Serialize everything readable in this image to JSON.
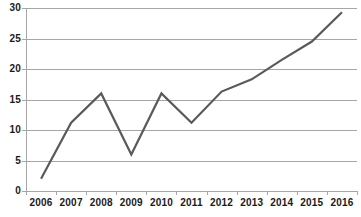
{
  "chart_data": {
    "type": "line",
    "title": "",
    "subtitle": "",
    "xlabel": "",
    "ylabel": "",
    "categories": [
      "2006",
      "2007",
      "2008",
      "2009",
      "2010",
      "2011",
      "2012",
      "2013",
      "2014",
      "2015",
      "2016"
    ],
    "series": [
      {
        "name": "Series 1",
        "values": [
          2,
          11.2,
          16,
          6,
          16,
          11.2,
          16.3,
          18.3,
          21.5,
          24.5,
          29.3
        ],
        "color": "#5a5a5a"
      }
    ],
    "ylim": [
      0,
      30
    ],
    "yticks": [
      0,
      5,
      10,
      15,
      20,
      25,
      30
    ],
    "ytick_labels": [
      "0",
      "5",
      "10",
      "15",
      "20",
      "25",
      "30"
    ],
    "grid": true,
    "grid_axis": "y",
    "grid_color": "#a6a6a6",
    "legend": false,
    "legend_position": "none",
    "markers": false,
    "background": "#ffffff",
    "axis_color": "#a6a6a6",
    "label_color": "#1a1a1a"
  }
}
